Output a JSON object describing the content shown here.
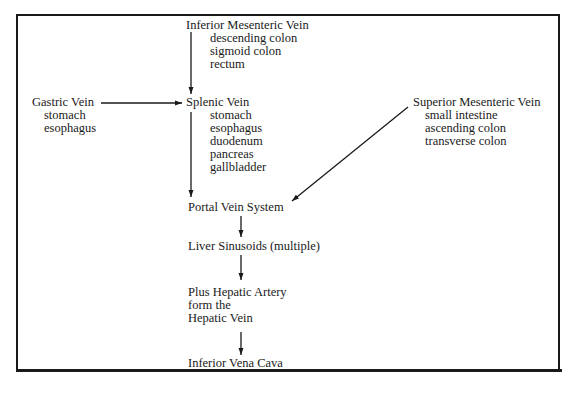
{
  "diagram": {
    "nodes": {
      "inferior_mesenteric": {
        "title": "Inferior Mesenteric Vein",
        "drains": [
          "descending colon",
          "sigmoid colon",
          "rectum"
        ]
      },
      "gastric": {
        "title": "Gastric Vein",
        "drains": [
          "stomach",
          "esophagus"
        ]
      },
      "splenic": {
        "title": "Splenic Vein",
        "drains": [
          "stomach",
          "esophagus",
          "duodenum",
          "pancreas",
          "gallbladder"
        ]
      },
      "superior_mesenteric": {
        "title": "Superior Mesenteric Vein",
        "drains": [
          "small intestine",
          "ascending colon",
          "transverse colon"
        ]
      },
      "portal": {
        "title": "Portal Vein System"
      },
      "sinusoids": {
        "title": "Liver Sinusoids (multiple)"
      },
      "hepatic": {
        "lines": [
          "Plus Hepatic Artery",
          "form the",
          "Hepatic Vein"
        ]
      },
      "ivc": {
        "title": "Inferior Vena Cava"
      }
    },
    "edges": [
      {
        "from": "Inferior Mesenteric Vein",
        "to": "Splenic Vein"
      },
      {
        "from": "Gastric Vein",
        "to": "Splenic Vein"
      },
      {
        "from": "Splenic Vein",
        "to": "Portal Vein System"
      },
      {
        "from": "Superior Mesenteric Vein",
        "to": "Portal Vein System"
      },
      {
        "from": "Portal Vein System",
        "to": "Liver Sinusoids (multiple)"
      },
      {
        "from": "Liver Sinusoids (multiple)",
        "to": "Hepatic Vein"
      },
      {
        "from": "Hepatic Vein",
        "to": "Inferior Vena Cava"
      }
    ],
    "colors": {
      "line": "#1a1a1a",
      "background": "#ffffff"
    }
  }
}
